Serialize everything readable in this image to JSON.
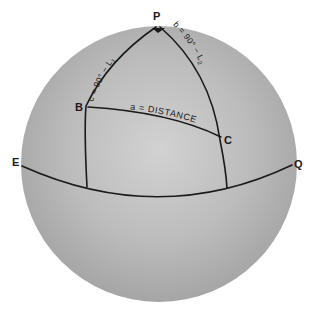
{
  "diagram": {
    "type": "spherical-triangle-on-sphere",
    "colors": {
      "background": "#ffffff",
      "sphere_highlight": "#d4d4d4",
      "sphere_mid": "#b8b8b8",
      "sphere_shadow": "#9c9c9c",
      "lines": "#1a1a1a",
      "text": "#1a1a1a"
    },
    "points": {
      "pole": "P",
      "vertex_b": "B",
      "vertex_c": "C",
      "equator_left": "E",
      "equator_right": "Q"
    },
    "sides": {
      "c": "c = 90° − L",
      "c_sub": "1",
      "b": "b = 90° − L",
      "b_sub": "2",
      "a": "a = DISTANCE"
    }
  }
}
